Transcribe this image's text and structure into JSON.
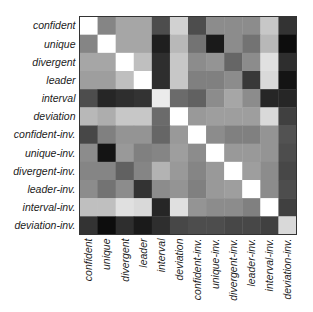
{
  "chart_data": {
    "type": "heatmap",
    "title": "",
    "xlabel": "",
    "ylabel": "",
    "colormap": "grayscale",
    "color_range": [
      0,
      1
    ],
    "color_low": "#000000",
    "color_high": "#ffffff",
    "legend": "none",
    "grid": false,
    "row_labels": [
      "confident",
      "unique",
      "divergent",
      "leader",
      "interval",
      "deviation",
      "confident-inv.",
      "unique-inv.",
      "divergent-inv.",
      "leader-inv.",
      "interval-inv.",
      "deviation-inv."
    ],
    "col_labels": [
      "confident",
      "unique",
      "divergent",
      "leader",
      "interval",
      "deviation",
      "confident-inv.",
      "unique-inv.",
      "divergent-inv.",
      "leader-inv.",
      "interval-inv.",
      "deviation-inv."
    ],
    "values": [
      [
        1.0,
        0.52,
        0.65,
        0.65,
        0.3,
        0.82,
        0.3,
        0.55,
        0.55,
        0.55,
        0.78,
        0.2
      ],
      [
        0.52,
        1.0,
        0.65,
        0.65,
        0.12,
        0.72,
        0.45,
        0.1,
        0.55,
        0.45,
        0.72,
        0.05
      ],
      [
        0.65,
        0.65,
        1.0,
        0.75,
        0.18,
        0.78,
        0.55,
        0.58,
        0.4,
        0.55,
        0.88,
        0.18
      ],
      [
        0.62,
        0.62,
        0.75,
        1.0,
        0.18,
        0.78,
        0.5,
        0.5,
        0.55,
        0.22,
        0.85,
        0.08
      ],
      [
        0.3,
        0.15,
        0.18,
        0.2,
        0.92,
        0.42,
        0.38,
        0.55,
        0.65,
        0.55,
        0.15,
        0.15
      ],
      [
        0.72,
        0.68,
        0.78,
        0.78,
        0.42,
        1.0,
        0.6,
        0.62,
        0.62,
        0.62,
        0.85,
        0.25
      ],
      [
        0.28,
        0.5,
        0.58,
        0.58,
        0.4,
        0.6,
        1.0,
        0.55,
        0.5,
        0.5,
        0.58,
        0.32
      ],
      [
        0.55,
        0.08,
        0.6,
        0.5,
        0.52,
        0.62,
        0.55,
        1.0,
        0.6,
        0.6,
        0.58,
        0.3
      ],
      [
        0.52,
        0.52,
        0.38,
        0.52,
        0.7,
        0.6,
        0.52,
        0.6,
        1.0,
        0.62,
        0.55,
        0.28
      ],
      [
        0.55,
        0.45,
        0.55,
        0.2,
        0.55,
        0.58,
        0.5,
        0.6,
        0.62,
        1.0,
        0.55,
        0.3
      ],
      [
        0.75,
        0.75,
        0.88,
        0.85,
        0.15,
        0.88,
        0.58,
        0.55,
        0.55,
        0.5,
        1.0,
        0.25
      ],
      [
        0.2,
        0.05,
        0.18,
        0.1,
        0.18,
        0.28,
        0.3,
        0.3,
        0.28,
        0.28,
        0.25,
        0.85
      ]
    ]
  }
}
